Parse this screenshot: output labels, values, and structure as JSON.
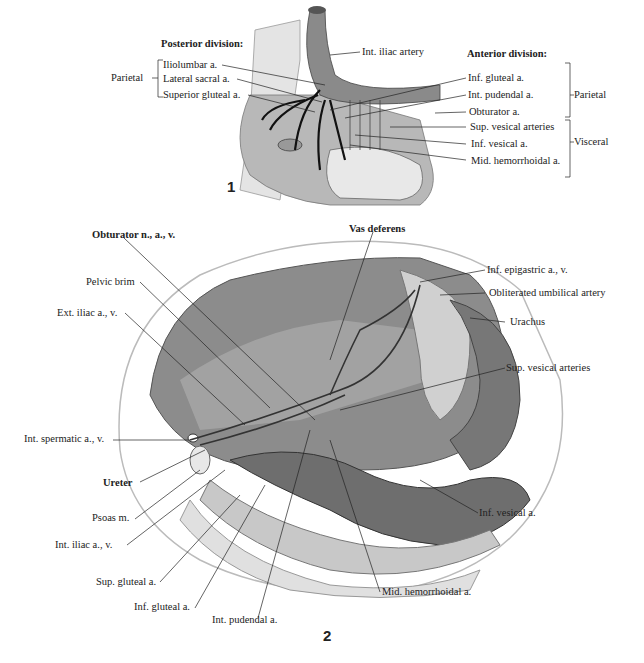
{
  "figure1": {
    "number": "1",
    "posterior_heading": "Posterior division:",
    "posterior_group": "Parietal",
    "posterior_items": [
      "Iliolumbar a.",
      "Lateral sacral a.",
      "Superior gluteal a."
    ],
    "top_label": "Int. iliac artery",
    "anterior_heading": "Anterior division:",
    "anterior_items": [
      "Inf. gluteal a.",
      "Int. pudendal a.",
      "Obturator a.",
      "Sup. vesical arteries",
      "Inf. vesical a.",
      "Mid. hemorrhoidal a."
    ],
    "anterior_groups": [
      "Parietal",
      "Visceral"
    ]
  },
  "figure2": {
    "number": "2",
    "left_labels": [
      "Obturator n., a., v.",
      "Pelvic brim",
      "Ext. iliac a., v.",
      "Int. spermatic a., v.",
      "Ureter",
      "Psoas m.",
      "Int. iliac a., v.",
      "Sup. gluteal a.",
      "Inf. gluteal a.",
      "Int. pudendal a."
    ],
    "top_label": "Vas deferens",
    "right_labels": [
      "Inf. epigastric a., v.",
      "Obliterated umbilical artery",
      "Urachus",
      "Sup. vesical arteries",
      "Inf. vesical a.",
      "Mid. hemorrhoidal a."
    ]
  },
  "colors": {
    "ink": "#222222",
    "tissue_dark": "#5a5a5a",
    "tissue_mid": "#9a9a9a",
    "tissue_light": "#d6d6d6",
    "background": "#ffffff"
  }
}
